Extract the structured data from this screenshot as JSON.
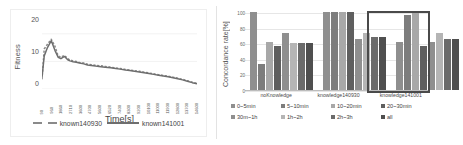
{
  "chart_data": [
    {
      "type": "line",
      "panel": "left",
      "title": "",
      "xlabel": "Time[s]",
      "ylabel": "Fitness",
      "ylim": [
        0,
        25
      ],
      "yticks": [
        0,
        10,
        20
      ],
      "grid": true,
      "legend_position": "bottom",
      "xticklabels": [
        "90",
        "960",
        "1860",
        "2710",
        "3600",
        "4700",
        "5600",
        "6520",
        "7400",
        "8300",
        "9200",
        "10100",
        "11000",
        "11900",
        "12800",
        "13700",
        "14600"
      ],
      "series": [
        {
          "name": "known140930",
          "style": "dashed",
          "color": "#8a8a8a",
          "x": [
            90,
            300,
            600,
            960,
            1300,
            1600,
            1860,
            2200,
            2500,
            2710,
            3000,
            3300,
            3600,
            4000,
            4350,
            4700,
            5100,
            5600,
            6000,
            6520,
            7000,
            7400,
            7900,
            8300,
            8750,
            9200,
            9650,
            10100,
            10550,
            11000,
            11450,
            11900,
            12350,
            12800,
            13250,
            13700,
            14150,
            14600
          ],
          "values": [
            3.5,
            14.5,
            16.2,
            18.0,
            15.5,
            12.0,
            11.5,
            12.2,
            11.0,
            10.5,
            10.2,
            10.0,
            9.6,
            9.4,
            9.0,
            8.8,
            8.6,
            8.4,
            8.2,
            7.9,
            7.6,
            7.4,
            7.1,
            6.9,
            6.6,
            6.4,
            6.1,
            5.8,
            5.5,
            5.2,
            4.9,
            4.6,
            4.3,
            3.9,
            3.5,
            3.0,
            2.5,
            2.0
          ]
        },
        {
          "name": "known141001",
          "style": "solid",
          "color": "#6e6e6e",
          "x": [
            90,
            300,
            600,
            960,
            1300,
            1600,
            1860,
            2200,
            2500,
            2710,
            3000,
            3300,
            3600,
            4000,
            4350,
            4700,
            5100,
            5600,
            6000,
            6520,
            7000,
            7400,
            7900,
            8300,
            8750,
            9200,
            9650,
            10100,
            10550,
            11000,
            11450,
            11900,
            12350,
            12800,
            13250,
            13700,
            14150,
            14600
          ],
          "values": [
            4.2,
            12.0,
            15.0,
            17.5,
            14.0,
            11.5,
            11.0,
            11.8,
            10.6,
            10.2,
            9.9,
            9.7,
            9.4,
            9.1,
            8.7,
            8.5,
            8.3,
            8.1,
            7.9,
            7.7,
            7.4,
            7.2,
            6.9,
            6.7,
            6.4,
            6.2,
            5.9,
            5.6,
            5.3,
            5.0,
            4.7,
            4.4,
            4.1,
            3.7,
            3.3,
            2.8,
            2.3,
            1.9
          ]
        }
      ]
    },
    {
      "type": "bar",
      "panel": "right",
      "title": "",
      "xlabel": "",
      "ylabel": "Concordance rate[%]",
      "ylim": [
        0,
        100
      ],
      "yticks": [
        0,
        20,
        40,
        60,
        80,
        100
      ],
      "grid": true,
      "legend_position": "bottom",
      "categories": [
        "noKnowledge",
        "knowledge140930",
        "knowledge141001"
      ],
      "highlight_category": "knowledge141001",
      "series": [
        {
          "name": "0~5min",
          "color": "#8f8f8f",
          "values": [
            100,
            100,
            61
          ]
        },
        {
          "name": "5~10min",
          "color": "#7d7d7d",
          "values": [
            33,
            100,
            96
          ]
        },
        {
          "name": "10~20min",
          "color": "#a8a8a8",
          "values": [
            61,
            100,
            100
          ]
        },
        {
          "name": "20~30min",
          "color": "#5f5f5f",
          "values": [
            56,
            100,
            57
          ]
        },
        {
          "name": "30m~1h",
          "color": "#8f8f8f",
          "values": [
            73,
            66,
            61
          ]
        },
        {
          "name": "1h~2h",
          "color": "#b5b5b5",
          "values": [
            60,
            73,
            73
          ]
        },
        {
          "name": "2h~3h",
          "color": "#6b6b6b",
          "values": [
            60,
            68,
            66
          ]
        },
        {
          "name": "all",
          "color": "#4f4f4f",
          "values": [
            60,
            68,
            66
          ]
        }
      ]
    }
  ],
  "left_panel": {
    "ylabel": "Fitness",
    "xlabel": "Time[s]",
    "yticks": [
      "20",
      "10",
      "0"
    ],
    "legend": [
      {
        "label": "known140930",
        "style": "dashed"
      },
      {
        "label": "known141001",
        "style": "solid"
      }
    ]
  },
  "right_panel": {
    "ylabel": "Concordance rate[%]",
    "yticks": [
      "100",
      "80",
      "60",
      "40",
      "20",
      "0"
    ],
    "categories": [
      "noKnowledge",
      "knowledge140930",
      "knowledge141001"
    ],
    "legend_row1": [
      "0~5min",
      "5~10min",
      "10~20min",
      "20~30min"
    ],
    "legend_row2": [
      "30m~1h",
      "1h~2h",
      "2h~3h",
      "all"
    ]
  }
}
